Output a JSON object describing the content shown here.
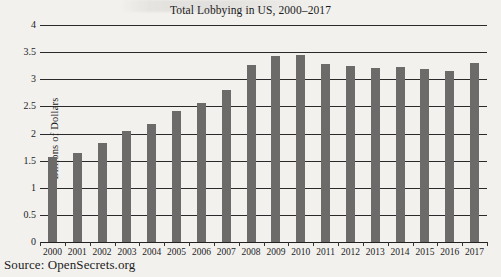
{
  "figure": {
    "source_note": "Source: OpenSecrets.org",
    "bar_color": "#6d6b69",
    "gridline_color": "#2a2a2a",
    "background_color": "#f2f1ee"
  },
  "chart_data": {
    "type": "bar",
    "title": "Total Lobbying in US, 2000–2017",
    "xlabel": "",
    "ylabel": "Billions of Dollars",
    "categories": [
      "2000",
      "2001",
      "2002",
      "2003",
      "2004",
      "2005",
      "2006",
      "2007",
      "2008",
      "2009",
      "2010",
      "2011",
      "2012",
      "2013",
      "2014",
      "2015",
      "2016",
      "2017"
    ],
    "values": [
      1.57,
      1.64,
      1.82,
      2.05,
      2.18,
      2.42,
      2.57,
      2.81,
      3.27,
      3.43,
      3.44,
      3.29,
      3.25,
      3.2,
      3.22,
      3.19,
      3.15,
      3.3
    ],
    "ylim": [
      0,
      4
    ],
    "yticks": [
      0,
      0.5,
      1,
      1.5,
      2,
      2.5,
      3,
      3.5,
      4
    ],
    "ytick_labels": [
      "0",
      "0.5",
      "1",
      "1.5",
      "2",
      "2.5",
      "3",
      "3.5",
      "4"
    ],
    "grid": true,
    "legend": false
  }
}
